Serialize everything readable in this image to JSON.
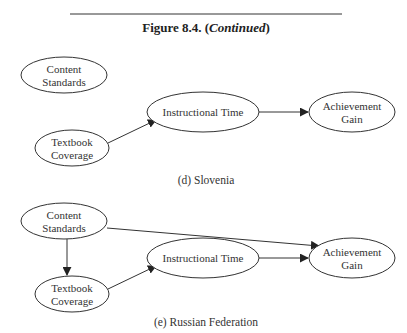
{
  "figure": {
    "title_prefix": "Figure 8.4. (",
    "title_italic": "Continued",
    "title_suffix": ")"
  },
  "panels": [
    {
      "caption": "(d) Slovenia",
      "nodes": {
        "content_standards": [
          "Content",
          "Standards"
        ],
        "textbook_coverage": [
          "Textbook",
          "Coverage"
        ],
        "instructional_time": [
          "Instructional Time"
        ],
        "achievement_gain": [
          "Achievement",
          "Gain"
        ]
      },
      "edges": [
        {
          "from": "textbook_coverage",
          "to": "instructional_time"
        },
        {
          "from": "instructional_time",
          "to": "achievement_gain"
        }
      ]
    },
    {
      "caption": "(e) Russian Federation",
      "nodes": {
        "content_standards": [
          "Content",
          "Standards"
        ],
        "textbook_coverage": [
          "Textbook",
          "Coverage"
        ],
        "instructional_time": [
          "Instructional Time"
        ],
        "achievement_gain": [
          "Achievement",
          "Gain"
        ]
      },
      "edges": [
        {
          "from": "content_standards",
          "to": "achievement_gain"
        },
        {
          "from": "content_standards",
          "to": "textbook_coverage"
        },
        {
          "from": "textbook_coverage",
          "to": "instructional_time"
        },
        {
          "from": "instructional_time",
          "to": "achievement_gain"
        }
      ]
    }
  ]
}
